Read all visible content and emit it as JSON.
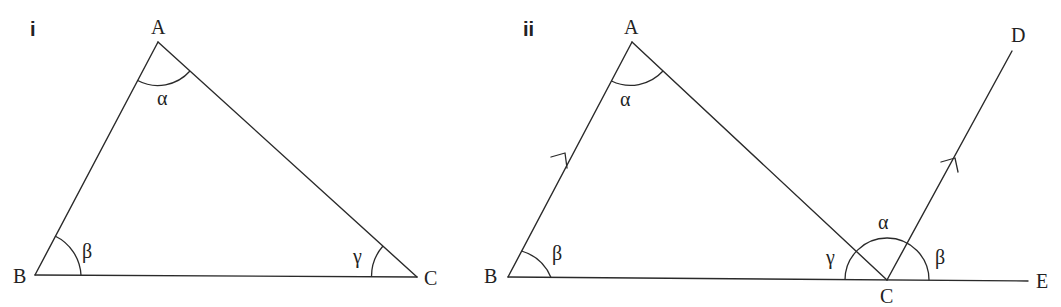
{
  "figures": [
    {
      "id": "i",
      "label": "i",
      "vertices": {
        "A": "A",
        "B": "B",
        "C": "C"
      },
      "angles": {
        "A": "α",
        "B": "β",
        "C": "γ"
      }
    },
    {
      "id": "ii",
      "label": "ii",
      "vertices": {
        "A": "A",
        "B": "B",
        "C": "C",
        "D": "D",
        "E": "E"
      },
      "angles": {
        "A": "α",
        "B": "β",
        "C_left": "γ",
        "C_middle": "α",
        "C_right": "β"
      },
      "parallel_lines": [
        "AB",
        "CD"
      ]
    }
  ]
}
